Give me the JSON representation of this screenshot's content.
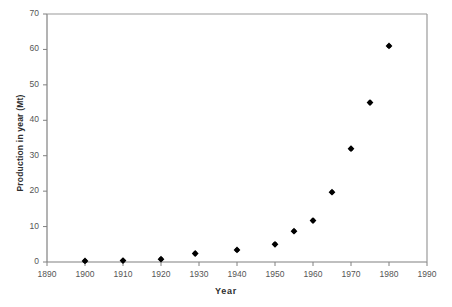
{
  "chart_data": {
    "type": "scatter",
    "title": "",
    "xlabel": "Year",
    "ylabel": "Production in year (Mt)",
    "xlim": [
      1890,
      1990
    ],
    "ylim": [
      0,
      70
    ],
    "xticks": [
      1890,
      1900,
      1910,
      1920,
      1930,
      1940,
      1950,
      1960,
      1970,
      1980,
      1990
    ],
    "yticks": [
      0,
      10,
      20,
      30,
      40,
      50,
      60,
      70
    ],
    "xtick_labels": [
      "1890",
      "1900",
      "1910",
      "1920",
      "1930",
      "1940",
      "1950",
      "1960",
      "1970",
      "1980",
      "1990"
    ],
    "ytick_labels": [
      "0",
      "10",
      "20",
      "30",
      "40",
      "50",
      "60",
      "70"
    ],
    "grid": false,
    "legend": false,
    "marker": "diamond",
    "marker_color": "#000000",
    "series": [
      {
        "name": "Production",
        "x": [
          1900,
          1910,
          1920,
          1929,
          1940,
          1950,
          1955,
          1960,
          1965,
          1970,
          1975,
          1980
        ],
        "y": [
          0.3,
          0.4,
          0.8,
          2.4,
          3.4,
          5.0,
          8.7,
          11.7,
          19.7,
          32.0,
          45.0,
          61.0
        ]
      }
    ]
  },
  "axes": {
    "x_title": "Year",
    "y_title": "Production in year (Mt)"
  }
}
